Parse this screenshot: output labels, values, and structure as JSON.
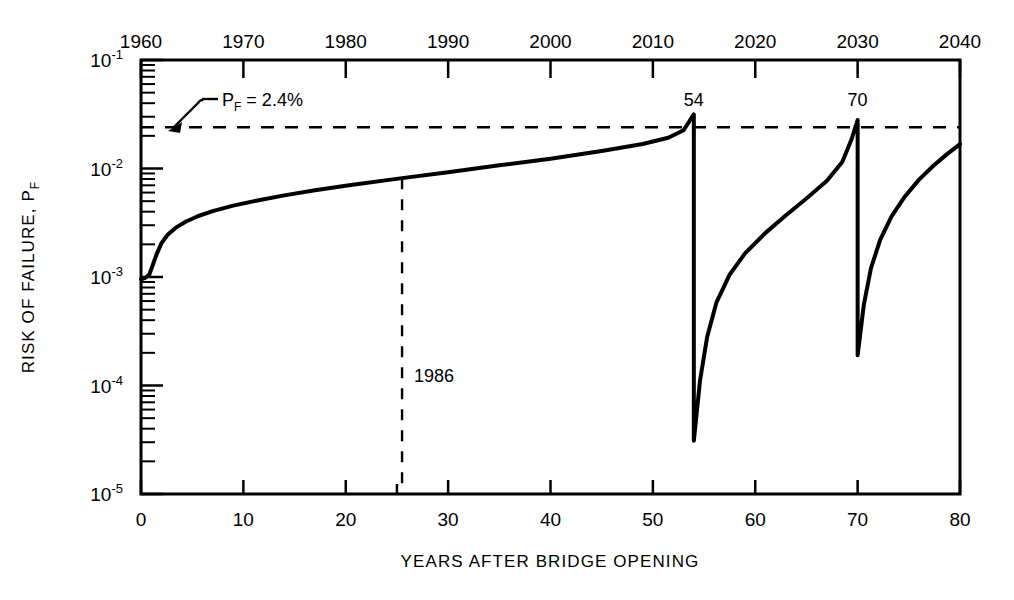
{
  "chart_data": {
    "type": "line",
    "title": "",
    "subtitle": "",
    "xlabel": "YEARS AFTER BRIDGE OPENING",
    "ylabel": "RISK OF FAILURE, P",
    "ylabel_sub": "F",
    "xlabel_top": "",
    "grid": false,
    "legend": "none",
    "yscale": "log",
    "ylim": [
      1e-05,
      0.1
    ],
    "xlim": [
      0,
      80
    ],
    "x_ticks": [
      0,
      10,
      20,
      30,
      40,
      50,
      60,
      70,
      80
    ],
    "x_tick_labels": [
      "0",
      "10",
      "20",
      "30",
      "40",
      "50",
      "60",
      "70",
      "80"
    ],
    "x_minor_ticks": [
      25
    ],
    "y_ticks": [
      1e-05,
      0.0001,
      0.001,
      0.01,
      0.1
    ],
    "y_tick_labels": [
      "10-5",
      "10-4",
      "10-3",
      "10-2",
      "10-1"
    ],
    "y_tick_bases": [
      "10",
      "10",
      "10",
      "10",
      "10"
    ],
    "y_tick_exps": [
      "-5",
      "-4",
      "-3",
      "-2",
      "-1"
    ],
    "top_axis_label": "Calendar Year",
    "top_ticks": [
      1960,
      1970,
      1980,
      1990,
      2000,
      2010,
      2020,
      2030,
      2040
    ],
    "top_tick_labels": [
      "1960",
      "1970",
      "1980",
      "1990",
      "2000",
      "2010",
      "2020",
      "2030",
      "2040"
    ],
    "top_axis_offset_years": 0,
    "threshold": {
      "value": 0.024,
      "label": "P",
      "label_sub": "F",
      "label_rest": " =  2.4%",
      "style": "dashed"
    },
    "annotations": [
      {
        "name": "year-1986-marker",
        "x": 25.5,
        "label": "1986",
        "style": "dashed-vertical"
      },
      {
        "name": "repair-peak-54",
        "x": 54,
        "label": "54"
      },
      {
        "name": "repair-peak-70",
        "x": 70,
        "label": "70"
      }
    ],
    "series": [
      {
        "name": "risk-of-failure",
        "points": [
          [
            0.0,
            0.00095
          ],
          [
            0.4,
            0.00098
          ],
          [
            0.8,
            0.00105
          ],
          [
            1.1,
            0.00125
          ],
          [
            1.5,
            0.0016
          ],
          [
            2.0,
            0.00205
          ],
          [
            2.6,
            0.00245
          ],
          [
            3.4,
            0.00285
          ],
          [
            4.4,
            0.00325
          ],
          [
            5.6,
            0.00365
          ],
          [
            7.0,
            0.00405
          ],
          [
            9.0,
            0.00455
          ],
          [
            11.5,
            0.0051
          ],
          [
            14.0,
            0.00565
          ],
          [
            17.0,
            0.0063
          ],
          [
            20.5,
            0.00705
          ],
          [
            25.5,
            0.00815
          ],
          [
            30.0,
            0.00925
          ],
          [
            35.0,
            0.0107
          ],
          [
            40.0,
            0.0123
          ],
          [
            45.0,
            0.0145
          ],
          [
            49.0,
            0.0168
          ],
          [
            51.5,
            0.0192
          ],
          [
            53.0,
            0.0225
          ],
          [
            54.0,
            0.0315
          ],
          [
            54.0,
            3.1e-05
          ],
          [
            54.6,
            0.00011
          ],
          [
            55.3,
            0.00028
          ],
          [
            56.2,
            0.00058
          ],
          [
            57.5,
            0.00105
          ],
          [
            59.0,
            0.00165
          ],
          [
            61.0,
            0.00255
          ],
          [
            63.0,
            0.0037
          ],
          [
            65.0,
            0.0053
          ],
          [
            67.0,
            0.0077
          ],
          [
            68.5,
            0.0115
          ],
          [
            69.4,
            0.0185
          ],
          [
            70.0,
            0.028
          ],
          [
            70.0,
            0.00019
          ],
          [
            70.6,
            0.00055
          ],
          [
            71.3,
            0.0012
          ],
          [
            72.2,
            0.0022
          ],
          [
            73.3,
            0.0036
          ],
          [
            74.6,
            0.0055
          ],
          [
            76.0,
            0.0079
          ],
          [
            77.4,
            0.0106
          ],
          [
            78.7,
            0.0135
          ],
          [
            80.0,
            0.0168
          ]
        ]
      }
    ]
  }
}
